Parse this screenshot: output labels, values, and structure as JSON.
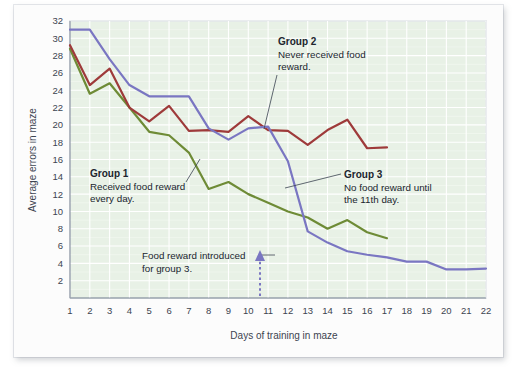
{
  "chart_data": {
    "type": "line",
    "title": "",
    "xlabel": "Days of training in maze",
    "ylabel": "Average errors in maze",
    "xlim": [
      1,
      22
    ],
    "ylim": [
      0,
      32
    ],
    "yticks": [
      2,
      4,
      6,
      8,
      10,
      12,
      14,
      16,
      18,
      20,
      22,
      24,
      26,
      28,
      30,
      32
    ],
    "xticks": [
      1,
      2,
      3,
      4,
      5,
      6,
      7,
      8,
      9,
      10,
      11,
      12,
      13,
      14,
      15,
      16,
      17,
      18,
      19,
      20,
      21,
      22
    ],
    "grid": true,
    "legend_position": "inline-annotations",
    "series": [
      {
        "name": "Group 1",
        "color": "#6e8b36",
        "x": [
          1,
          2,
          3,
          4,
          5,
          6,
          7,
          8,
          9,
          10,
          11,
          12,
          13,
          14,
          15,
          16,
          17
        ],
        "values": [
          28.8,
          23.6,
          24.8,
          22.0,
          19.2,
          18.8,
          16.8,
          12.6,
          13.4,
          12.0,
          11.0,
          10.0,
          9.3,
          8.0,
          9.0,
          7.6,
          6.9
        ]
      },
      {
        "name": "Group 2",
        "color": "#9e3a3a",
        "x": [
          1,
          2,
          3,
          4,
          5,
          6,
          7,
          8,
          9,
          10,
          11,
          12,
          13,
          14,
          15,
          16,
          17
        ],
        "values": [
          29.2,
          24.6,
          26.5,
          22.0,
          20.4,
          22.2,
          19.3,
          19.4,
          19.2,
          21.0,
          19.4,
          19.3,
          17.7,
          19.4,
          20.6,
          17.3,
          17.4
        ]
      },
      {
        "name": "Group 3",
        "color": "#7a76c2",
        "x": [
          1,
          2,
          3,
          4,
          5,
          6,
          7,
          8,
          9,
          10,
          11,
          12,
          13,
          14,
          15,
          16,
          17,
          18,
          19,
          20,
          21,
          22
        ],
        "values": [
          31.0,
          31.0,
          27.6,
          24.6,
          23.3,
          23.3,
          23.3,
          19.6,
          18.3,
          19.6,
          19.8,
          15.8,
          7.7,
          6.4,
          5.4,
          5.0,
          4.7,
          4.2,
          4.2,
          3.3,
          3.3,
          3.4
        ]
      }
    ],
    "annotations": [
      {
        "id": "group-1",
        "title": "Group 1",
        "body_lines": [
          "Received food reward",
          "every day."
        ]
      },
      {
        "id": "group-2",
        "title": "Group 2",
        "body_lines": [
          "Never received food",
          "reward."
        ]
      },
      {
        "id": "group-3",
        "title": "Group 3",
        "body_lines": [
          "No food reward until",
          "the 11th day."
        ]
      },
      {
        "id": "food-reward-marker",
        "title": "",
        "body_lines": [
          "Food reward introduced",
          "for group 3."
        ],
        "marker_day": 11
      }
    ],
    "colors": {
      "group1": "#6e8b36",
      "group2": "#9e3a3a",
      "group3": "#7a76c2",
      "plot_background": "#e8f1e6",
      "grid": "#ffffff",
      "minor_grid": "#f5faf4",
      "axis": "#9aa3ae",
      "card": "#fcfcfc"
    }
  }
}
